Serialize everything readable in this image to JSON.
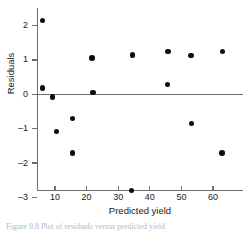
{
  "figure": {
    "caption": "Figure 9.8   Plot of residuals versus predicted yield"
  },
  "chart_data": {
    "type": "scatter",
    "title": "",
    "xlabel": "Predicted yield",
    "ylabel": "Residuals",
    "xlim": [
      2,
      67
    ],
    "ylim": [
      -3,
      2.35
    ],
    "xticks": [
      10,
      20,
      30,
      40,
      50,
      60
    ],
    "xticklabels": [
      "10",
      "20",
      "30",
      "40",
      "50",
      "60"
    ],
    "yticks": [
      2,
      1,
      0,
      -1,
      -2,
      -3
    ],
    "yticklabels": [
      "2",
      "1",
      "0",
      "–1",
      "–2",
      "–3"
    ],
    "grid": false,
    "legend": "none",
    "reference_line": {
      "y": 0,
      "color": "#6f6f6f"
    },
    "marker": {
      "shape": "circle",
      "color": "#0d0d0d",
      "size": 5.6
    },
    "points": [
      {
        "x": 6.0,
        "y": 2.15
      },
      {
        "x": 6.0,
        "y": 0.18
      },
      {
        "x": 9.2,
        "y": -0.07
      },
      {
        "x": 10.5,
        "y": -1.08
      },
      {
        "x": 15.6,
        "y": -0.7
      },
      {
        "x": 15.6,
        "y": -1.7
      },
      {
        "x": 21.8,
        "y": 1.05
      },
      {
        "x": 22.0,
        "y": 0.05
      },
      {
        "x": 34.5,
        "y": 1.15
      },
      {
        "x": 34.2,
        "y": -2.8
      },
      {
        "x": 45.8,
        "y": 1.25
      },
      {
        "x": 45.6,
        "y": 0.28
      },
      {
        "x": 53.0,
        "y": 1.13
      },
      {
        "x": 53.2,
        "y": -0.85
      },
      {
        "x": 63.0,
        "y": 1.25
      },
      {
        "x": 62.8,
        "y": -1.7
      }
    ]
  }
}
